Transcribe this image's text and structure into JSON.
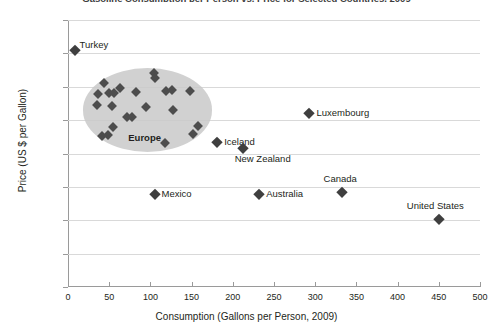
{
  "chart_data": {
    "type": "scatter",
    "title": "Gasoline Consumption per Person vs. Price for Selected Countries, 2009",
    "xlabel": "Consumption (Gallons per Person, 2009)",
    "ylabel": "Price (US $ per Gallon)",
    "xlim": [
      0,
      500
    ],
    "ylim": [
      0,
      8
    ],
    "xticks": [
      "0",
      "50",
      "100",
      "150",
      "200",
      "250",
      "300",
      "350",
      "400",
      "450",
      "500"
    ],
    "yticks": [
      "$0.00",
      "$1.00",
      "$2.00",
      "$3.00",
      "$4.00",
      "$5.00",
      "$6.00",
      "$7.00",
      "$8.00"
    ],
    "grid": "horizontal",
    "legend": "none",
    "marker_color": "#4d4d4d",
    "marker_shape": "diamond",
    "annotations": [
      {
        "text": "Europe",
        "type": "group-highlight",
        "x": 95,
        "y": 4.45,
        "shape": "ellipse",
        "color": "#c9c9c9"
      }
    ],
    "labeled_points": [
      {
        "name": "Turkey",
        "x": 8,
        "y": 7.1
      },
      {
        "name": "Luxembourg",
        "x": 293,
        "y": 5.2
      },
      {
        "name": "Iceland",
        "x": 181,
        "y": 4.35
      },
      {
        "name": "New Zealand",
        "x": 212,
        "y": 4.15
      },
      {
        "name": "Mexico",
        "x": 105,
        "y": 2.8
      },
      {
        "name": "Australia",
        "x": 232,
        "y": 2.8
      },
      {
        "name": "Canada",
        "x": 332,
        "y": 2.85
      },
      {
        "name": "United States",
        "x": 450,
        "y": 2.05
      }
    ],
    "europe_cluster_points": [
      {
        "x": 44,
        "y": 6.1
      },
      {
        "x": 104,
        "y": 6.4
      },
      {
        "x": 106,
        "y": 6.25
      },
      {
        "x": 63,
        "y": 5.95
      },
      {
        "x": 37,
        "y": 5.78
      },
      {
        "x": 50,
        "y": 5.8
      },
      {
        "x": 56,
        "y": 5.82
      },
      {
        "x": 82,
        "y": 5.85
      },
      {
        "x": 119,
        "y": 5.88
      },
      {
        "x": 126,
        "y": 5.9
      },
      {
        "x": 148,
        "y": 5.88
      },
      {
        "x": 35,
        "y": 5.45
      },
      {
        "x": 53,
        "y": 5.42
      },
      {
        "x": 95,
        "y": 5.4
      },
      {
        "x": 128,
        "y": 5.3
      },
      {
        "x": 72,
        "y": 5.1
      },
      {
        "x": 78,
        "y": 5.08
      },
      {
        "x": 55,
        "y": 4.78
      },
      {
        "x": 158,
        "y": 4.82
      },
      {
        "x": 41,
        "y": 4.52
      },
      {
        "x": 49,
        "y": 4.55
      },
      {
        "x": 152,
        "y": 4.58
      },
      {
        "x": 118,
        "y": 4.3
      }
    ]
  }
}
